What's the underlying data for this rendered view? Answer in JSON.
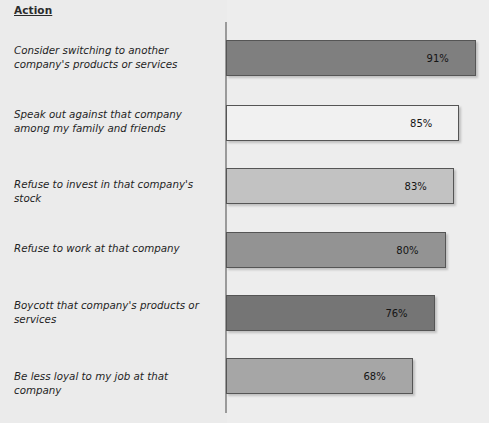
{
  "chart_data": {
    "type": "bar",
    "orientation": "horizontal",
    "title": "",
    "xlabel": "",
    "ylabel": "Action",
    "axis_title": "Action",
    "grid": false,
    "legend": null,
    "value_suffix": "%",
    "xlim": [
      0,
      100
    ],
    "categories": [
      "Consider switching to another company's products or services",
      "Speak out against that company among my family and friends",
      "Refuse to invest in that company's stock",
      "Refuse to work at that company",
      "Boycott that company's products or services",
      "Be less loyal to my job at that company"
    ],
    "values": [
      91,
      85,
      83,
      80,
      76,
      68
    ],
    "value_labels": [
      "91%",
      "85%",
      "83%",
      "80%",
      "76%",
      "68%"
    ],
    "bar_colors": [
      "#7f7f7f",
      "#f1f1f1",
      "#c2c2c2",
      "#939393",
      "#757575",
      "#a6a6a6"
    ],
    "bar_border_color": "#555555",
    "axis_color": "#9a9a9a",
    "background_color": "#ebebeb"
  }
}
